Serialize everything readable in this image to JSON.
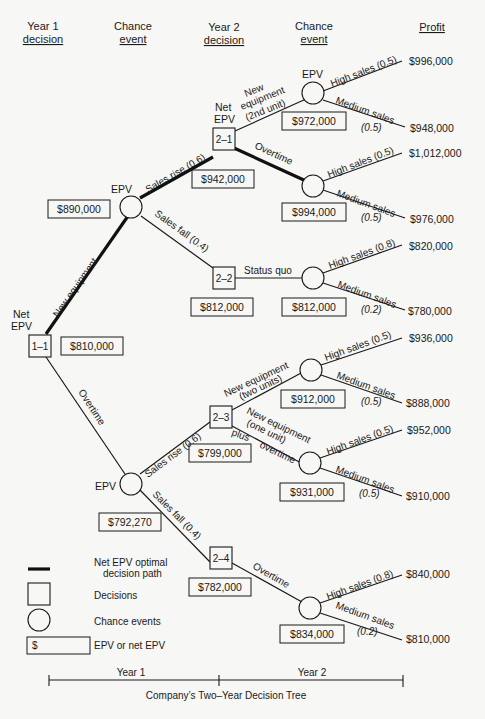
{
  "header": {
    "col1_line1": "Year 1",
    "col1_line2": "decision",
    "col2_line1": "Chance",
    "col2_line2": "event",
    "col3_line1": "Year 2",
    "col3_line2": "decision",
    "col4_line1": "Chance",
    "col4_line2": "event",
    "col5": "Profit"
  },
  "root": {
    "label_line1": "Net",
    "label_line2": "EPV",
    "id": "1–1",
    "value": "$810,000"
  },
  "branches": {
    "new_equipment": "New equipment",
    "overtime": "Overtime"
  },
  "chance_a": {
    "label": "EPV",
    "value": "$890,000",
    "rise": "Sales rise (0.6)",
    "fall": "Sales fall (0.4)"
  },
  "chance_b": {
    "label": "EPV",
    "value": "$792,270",
    "rise": "Sales rise (0.6)",
    "fall": "Sales fall (0.4)"
  },
  "d21": {
    "label_line1": "Net",
    "label_line2": "EPV",
    "id": "2–1",
    "value": "$942,000",
    "opt1_line1": "New",
    "opt1_line2": "equipment",
    "opt1_line3": "(2nd unit)",
    "opt2": "Overtime"
  },
  "d22": {
    "id": "2–2",
    "value": "$812,000",
    "opt1": "Status quo"
  },
  "d23": {
    "id": "2–3",
    "value": "$799,000",
    "opt1_line1": "New equipment",
    "opt1_line2": "(two units)",
    "opt2_line1": "New equipment",
    "opt2_line2": "(one unit)",
    "opt2_line3": "plus",
    "opt2_line4": "overtime"
  },
  "d24": {
    "id": "2–4",
    "value": "$782,000",
    "opt1": "Overtime"
  },
  "outcomes": [
    {
      "epv_label": "EPV",
      "value": "$972,000",
      "high": "High sales (0.5)",
      "medium": "Medium sales",
      "medium_p": "(0.5)",
      "profit_high": "$996,000",
      "profit_medium": "$948,000"
    },
    {
      "value": "$994,000",
      "high": "High sales (0.5)",
      "medium": "Medium sales",
      "medium_p": "(0.5)",
      "profit_high": "$1,012,000",
      "profit_medium": "$976,000"
    },
    {
      "value": "$812,000",
      "high": "High sales (0.8)",
      "medium": "Medium sales",
      "medium_p": "(0.2)",
      "profit_high": "$820,000",
      "profit_medium": "$780,000"
    },
    {
      "value": "$912,000",
      "high": "High sales (0.5)",
      "medium": "Medium sales",
      "medium_p": "(0.5)",
      "profit_high": "$936,000",
      "profit_medium": "$888,000"
    },
    {
      "value": "$931,000",
      "high": "High sales (0.5)",
      "medium": "Medium sales",
      "medium_p": "(0.5)",
      "profit_high": "$952,000",
      "profit_medium": "$910,000"
    },
    {
      "value": "$834,000",
      "high": "High sales (0.8)",
      "medium": "Medium sales",
      "medium_p": "(0.2)",
      "profit_high": "$840,000",
      "profit_medium": "$810,000"
    }
  ],
  "legend": {
    "path_line1": "Net EPV optimal",
    "path_line2": "decision path",
    "decisions": "Decisions",
    "chance": "Chance events",
    "dollar_symbol": "$",
    "epv": "EPV or net EPV"
  },
  "timeline": {
    "year1": "Year 1",
    "year2": "Year 2",
    "caption": "Company’s Two–Year Decision Tree"
  },
  "colors": {
    "ink": "#1a1a1a",
    "paper": "#f7f7f5"
  }
}
